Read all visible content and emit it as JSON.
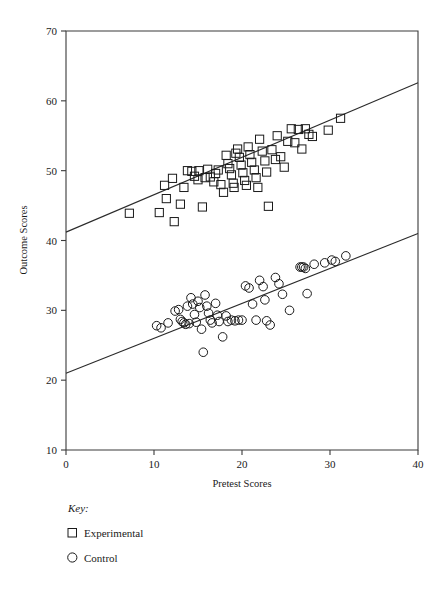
{
  "chart_data": {
    "type": "scatter",
    "title": "",
    "xlabel": "Pretest Scores",
    "ylabel": "Outcome Scores",
    "xlim": [
      0,
      40
    ],
    "ylim": [
      10,
      70
    ],
    "xticks": [
      0,
      10,
      20,
      30,
      40
    ],
    "yticks": [
      10,
      20,
      30,
      40,
      50,
      60,
      70
    ],
    "xtick_labels": [
      "0",
      "10",
      "20",
      "30",
      "40"
    ],
    "ytick_labels": [
      "10",
      "20",
      "30",
      "40",
      "50",
      "60",
      "70"
    ],
    "grid": false,
    "legend_position": "below-axes-left",
    "legend_title": "Key:",
    "series": [
      {
        "name": "Experimental",
        "marker": "square",
        "trendline": {
          "x": [
            0,
            40
          ],
          "y": [
            41.2,
            62.6
          ]
        },
        "points": [
          [
            7.2,
            43.9
          ],
          [
            10.6,
            44.0
          ],
          [
            11.4,
            46.0
          ],
          [
            11.2,
            47.9
          ],
          [
            12.1,
            48.9
          ],
          [
            12.3,
            42.7
          ],
          [
            13.0,
            45.2
          ],
          [
            13.4,
            47.6
          ],
          [
            13.8,
            50.0
          ],
          [
            14.3,
            49.9
          ],
          [
            14.6,
            49.2
          ],
          [
            15.0,
            48.7
          ],
          [
            15.1,
            50.0
          ],
          [
            15.5,
            44.8
          ],
          [
            15.8,
            49.0
          ],
          [
            16.1,
            50.2
          ],
          [
            16.4,
            49.1
          ],
          [
            16.8,
            48.4
          ],
          [
            17.0,
            49.6
          ],
          [
            17.3,
            50.1
          ],
          [
            17.6,
            48.0
          ],
          [
            17.9,
            46.9
          ],
          [
            18.2,
            52.2
          ],
          [
            18.4,
            51.0
          ],
          [
            18.6,
            50.3
          ],
          [
            18.8,
            49.4
          ],
          [
            19.0,
            48.2
          ],
          [
            19.1,
            47.6
          ],
          [
            19.3,
            52.5
          ],
          [
            19.5,
            53.1
          ],
          [
            19.7,
            51.9
          ],
          [
            19.9,
            50.8
          ],
          [
            20.1,
            49.7
          ],
          [
            20.3,
            48.6
          ],
          [
            20.5,
            47.9
          ],
          [
            20.7,
            53.4
          ],
          [
            20.9,
            52.3
          ],
          [
            21.1,
            51.2
          ],
          [
            21.4,
            50.1
          ],
          [
            21.6,
            49.0
          ],
          [
            21.8,
            47.6
          ],
          [
            22.0,
            54.5
          ],
          [
            22.3,
            52.8
          ],
          [
            22.6,
            51.4
          ],
          [
            22.8,
            49.8
          ],
          [
            23.0,
            44.9
          ],
          [
            23.4,
            53.0
          ],
          [
            23.8,
            51.6
          ],
          [
            24.0,
            55.0
          ],
          [
            24.4,
            52.0
          ],
          [
            24.8,
            50.5
          ],
          [
            25.2,
            54.2
          ],
          [
            25.6,
            56.0
          ],
          [
            26.0,
            54.0
          ],
          [
            26.4,
            55.9
          ],
          [
            26.8,
            53.1
          ],
          [
            27.2,
            56.0
          ],
          [
            27.6,
            55.2
          ],
          [
            28.0,
            54.9
          ],
          [
            29.8,
            55.8
          ],
          [
            31.2,
            57.5
          ]
        ]
      },
      {
        "name": "Control",
        "marker": "circle",
        "trendline": {
          "x": [
            0,
            40
          ],
          "y": [
            21.0,
            41.0
          ]
        },
        "points": [
          [
            10.3,
            27.8
          ],
          [
            10.8,
            27.5
          ],
          [
            11.6,
            28.2
          ],
          [
            12.4,
            29.9
          ],
          [
            12.8,
            30.1
          ],
          [
            13.0,
            28.7
          ],
          [
            13.2,
            28.4
          ],
          [
            13.4,
            28.2
          ],
          [
            13.6,
            28.0
          ],
          [
            13.8,
            30.6
          ],
          [
            14.0,
            28.1
          ],
          [
            14.2,
            31.8
          ],
          [
            14.4,
            30.9
          ],
          [
            14.6,
            29.4
          ],
          [
            14.8,
            28.3
          ],
          [
            15.0,
            31.3
          ],
          [
            15.2,
            30.4
          ],
          [
            15.4,
            27.3
          ],
          [
            15.6,
            24.0
          ],
          [
            15.8,
            32.2
          ],
          [
            16.0,
            30.6
          ],
          [
            16.2,
            29.6
          ],
          [
            16.4,
            28.6
          ],
          [
            16.6,
            28.2
          ],
          [
            17.0,
            31.0
          ],
          [
            17.2,
            29.3
          ],
          [
            17.4,
            28.4
          ],
          [
            17.8,
            26.2
          ],
          [
            18.2,
            29.2
          ],
          [
            18.4,
            28.4
          ],
          [
            18.8,
            28.6
          ],
          [
            19.2,
            28.5
          ],
          [
            19.6,
            28.6
          ],
          [
            20.0,
            28.6
          ],
          [
            20.4,
            33.5
          ],
          [
            20.8,
            33.2
          ],
          [
            21.2,
            30.9
          ],
          [
            21.6,
            28.6
          ],
          [
            22.0,
            34.3
          ],
          [
            22.4,
            33.4
          ],
          [
            22.6,
            31.5
          ],
          [
            22.8,
            28.5
          ],
          [
            23.2,
            27.9
          ],
          [
            23.8,
            34.7
          ],
          [
            24.2,
            33.8
          ],
          [
            24.6,
            32.3
          ],
          [
            25.4,
            30.0
          ],
          [
            26.6,
            36.2
          ],
          [
            26.8,
            36.2
          ],
          [
            27.0,
            36.2
          ],
          [
            27.2,
            36.0
          ],
          [
            27.4,
            32.4
          ],
          [
            28.2,
            36.6
          ],
          [
            29.4,
            36.8
          ],
          [
            30.2,
            37.2
          ],
          [
            30.6,
            37.0
          ],
          [
            31.8,
            37.8
          ]
        ]
      }
    ]
  },
  "axes": {
    "y_title": "Outcome Scores",
    "x_title": "Pretest Scores"
  },
  "legend": {
    "title": "Key:",
    "items": [
      {
        "label": "Experimental",
        "marker": "square"
      },
      {
        "label": "Control",
        "marker": "circle"
      }
    ]
  }
}
